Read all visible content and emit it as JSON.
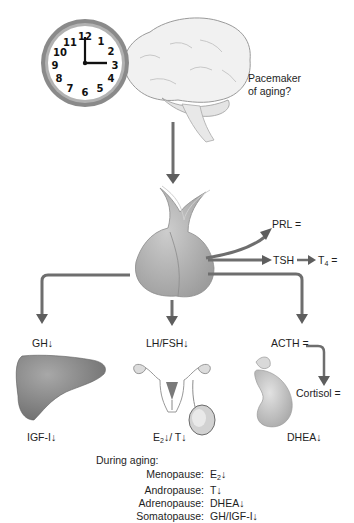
{
  "diagram": {
    "clock": {
      "numbers": [
        "12",
        "1",
        "2",
        "3",
        "4",
        "5",
        "6",
        "7",
        "8",
        "9",
        "10",
        "11"
      ],
      "time": "3:00"
    },
    "brain_label_line1": "Pacemaker",
    "brain_label_line2": "of aging?",
    "pituitary_outputs": {
      "prl": "PRL =",
      "tsh": "TSH",
      "t4_base": "T",
      "t4_sub": "4",
      "t4_suffix": " =",
      "gh": "GH↓",
      "lhfsh": "LH/FSH↓",
      "acth": "ACTH =",
      "cortisol": "Cortisol ="
    },
    "targets": {
      "liver_product": "IGF-I↓",
      "gonad_e": "E",
      "gonad_e_sub": "2",
      "gonad_rest": "↓/ T↓",
      "adrenal_product": "DHEA↓"
    },
    "summary": {
      "title": "During aging:",
      "rows": [
        {
          "label": "Menopause:",
          "value_base": "E",
          "value_sub": "2",
          "value_suffix": "↓"
        },
        {
          "label": "Andropause:",
          "value_base": "T↓",
          "value_sub": "",
          "value_suffix": ""
        },
        {
          "label": "Adrenopause:",
          "value_base": "DHEA↓",
          "value_sub": "",
          "value_suffix": ""
        },
        {
          "label": "Somatopause:",
          "value_base": "GH/IGF-I↓",
          "value_sub": "",
          "value_suffix": ""
        }
      ]
    }
  },
  "colors": {
    "arrow": "#6e6e6e",
    "organ": "#b5b5b5",
    "clock_rim": "#7d7d7d",
    "brain": "#f1f1f1"
  }
}
